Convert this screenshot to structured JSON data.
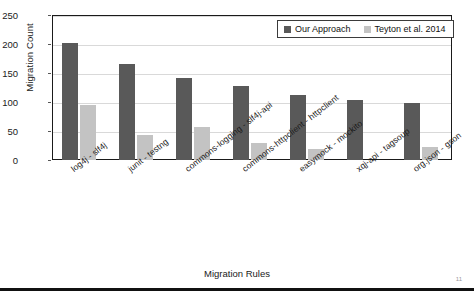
{
  "chart_data": {
    "type": "bar",
    "title": "",
    "xlabel": "Migration Rules",
    "ylabel": "Migration Count",
    "ylim": [
      0,
      250
    ],
    "yticks": [
      0,
      50,
      100,
      150,
      200,
      250
    ],
    "grid": true,
    "legend_position": "top-right",
    "categories": [
      "log4j - slf4j",
      "junit - testng",
      "commons-logging - slf4j-api",
      "commons-httpclient - httpclient",
      "easymock - mockito",
      "xqj-api - tagsoup",
      "org.json - gson"
    ],
    "series": [
      {
        "name": "Our Approach",
        "color": "#595959",
        "values": [
          202,
          165,
          141,
          128,
          112,
          104,
          98
        ]
      },
      {
        "name": "Teyton et al. 2014",
        "color": "#c3c3c3",
        "values": [
          94,
          43,
          57,
          29,
          19,
          0,
          23
        ]
      }
    ]
  },
  "legend": {
    "items": [
      {
        "label": "Our Approach",
        "color": "#595959"
      },
      {
        "label": "Teyton et al. 2014",
        "color": "#c3c3c3"
      }
    ]
  },
  "axes": {
    "y_title": "Migration Count",
    "x_title": "Migration Rules",
    "y_tick_labels": [
      "250",
      "200",
      "150",
      "100",
      "50",
      "0"
    ]
  },
  "page": {
    "number": "11"
  }
}
